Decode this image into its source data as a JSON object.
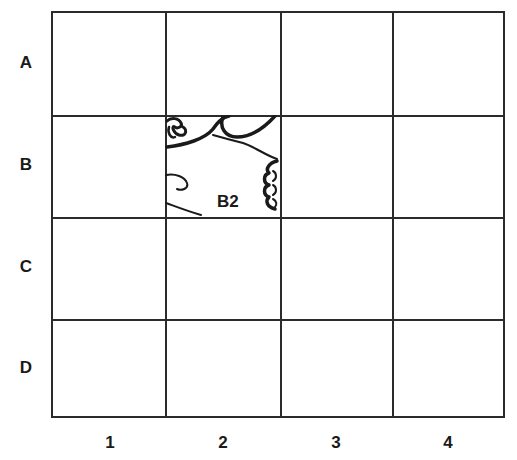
{
  "grid": {
    "rows": [
      "A",
      "B",
      "C",
      "D"
    ],
    "columns": [
      "1",
      "2",
      "3",
      "4"
    ],
    "filled_cell": {
      "row": "B",
      "column": "2",
      "label": "B2",
      "content": "line-drawing fragment"
    }
  },
  "colors": {
    "line": "#2b2b2b",
    "text": "#1a1a1a",
    "background": "#ffffff"
  }
}
